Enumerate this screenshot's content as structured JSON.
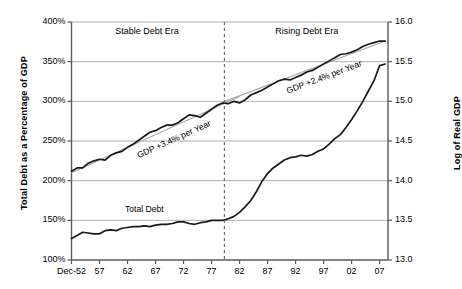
{
  "chart_data": {
    "type": "line",
    "title": "",
    "xlabel": "",
    "ylabel": "Total Debt as a Percentage of GDP",
    "y2label": "Log of Real GDP",
    "grid": true,
    "legend": "none",
    "x_tick_labels": [
      "Dec-52",
      "57",
      "62",
      "67",
      "72",
      "77",
      "82",
      "87",
      "92",
      "97",
      "02",
      "07"
    ],
    "x_tick_years": [
      1952,
      1957,
      1962,
      1967,
      1972,
      1977,
      1982,
      1987,
      1992,
      1997,
      2002,
      2007
    ],
    "xlim": [
      1952,
      2008.5
    ],
    "ylim": [
      100,
      400
    ],
    "y_tick_labels": [
      "100%",
      "150%",
      "200%",
      "250%",
      "300%",
      "350%",
      "400%"
    ],
    "y_ticks": [
      100,
      150,
      200,
      250,
      300,
      350,
      400
    ],
    "y2lim": [
      13.0,
      16.0
    ],
    "y2_tick_labels": [
      "13.0",
      "13.5",
      "14.0",
      "14.5",
      "15.0",
      "15.5",
      "16.0"
    ],
    "y2_ticks": [
      13.0,
      13.5,
      14.0,
      14.5,
      15.0,
      15.5,
      16.0
    ],
    "series": [
      {
        "name": "Total Debt",
        "axis": "left",
        "units": "percent of GDP",
        "color": "#1a1a1a",
        "x": [
          1952,
          1953,
          1954,
          1955,
          1956,
          1957,
          1958,
          1959,
          1960,
          1961,
          1962,
          1963,
          1964,
          1965,
          1966,
          1967,
          1968,
          1969,
          1970,
          1971,
          1972,
          1973,
          1974,
          1975,
          1976,
          1977,
          1978,
          1979,
          1980,
          1981,
          1982,
          1983,
          1984,
          1985,
          1986,
          1987,
          1988,
          1989,
          1990,
          1991,
          1992,
          1993,
          1994,
          1995,
          1996,
          1997,
          1998,
          1999,
          2000,
          2001,
          2002,
          2003,
          2004,
          2005,
          2006,
          2007,
          2008
        ],
        "values": [
          127,
          131,
          135,
          134,
          133,
          133,
          137,
          138,
          137,
          140,
          141,
          142,
          142,
          143,
          142,
          144,
          145,
          145,
          146,
          148,
          148,
          146,
          145,
          147,
          148,
          150,
          150,
          150,
          152,
          155,
          160,
          167,
          175,
          186,
          199,
          209,
          216,
          221,
          226,
          229,
          230,
          232,
          231,
          233,
          237,
          240,
          246,
          253,
          258,
          267,
          277,
          288,
          300,
          313,
          326,
          345,
          347
        ]
      },
      {
        "name": "Log of Real GDP",
        "axis": "right",
        "units": "log index",
        "color": "#1a1a1a",
        "x": [
          1952,
          1953,
          1954,
          1955,
          1956,
          1957,
          1958,
          1959,
          1960,
          1961,
          1962,
          1963,
          1964,
          1965,
          1966,
          1967,
          1968,
          1969,
          1970,
          1971,
          1972,
          1973,
          1974,
          1975,
          1976,
          1977,
          1978,
          1979,
          1980,
          1981,
          1982,
          1983,
          1984,
          1985,
          1986,
          1987,
          1988,
          1989,
          1990,
          1991,
          1992,
          1993,
          1994,
          1995,
          1996,
          1997,
          1998,
          1999,
          2000,
          2001,
          2002,
          2003,
          2004,
          2005,
          2006,
          2007,
          2008
        ],
        "values": [
          14.12,
          14.16,
          14.16,
          14.22,
          14.25,
          14.27,
          14.26,
          14.32,
          14.35,
          14.37,
          14.42,
          14.46,
          14.51,
          14.56,
          14.61,
          14.63,
          14.67,
          14.7,
          14.7,
          14.73,
          14.78,
          14.83,
          14.82,
          14.8,
          14.85,
          14.9,
          14.95,
          14.98,
          14.97,
          15.0,
          14.98,
          15.02,
          15.08,
          15.11,
          15.14,
          15.18,
          15.22,
          15.26,
          15.28,
          15.27,
          15.3,
          15.33,
          15.37,
          15.39,
          15.43,
          15.47,
          15.51,
          15.55,
          15.59,
          15.6,
          15.62,
          15.65,
          15.69,
          15.72,
          15.74,
          15.76,
          15.76
        ]
      }
    ],
    "trend_lines": [
      {
        "name": "gdp-trend-stable-era",
        "label": "GDP +3.4% per Year",
        "axis": "right",
        "growth_rate_percent": 3.4,
        "color": "#a8a8a8",
        "x_start": 1952,
        "x_end": 1982,
        "y_start": 14.1,
        "y_end": 15.06
      },
      {
        "name": "gdp-trend-rising-era",
        "label": "GDP +2.4% per Year",
        "axis": "right",
        "growth_rate_percent": 2.4,
        "color": "#a8a8a8",
        "x_start": 1979,
        "x_end": 2008,
        "y_start": 14.99,
        "y_end": 15.76
      }
    ],
    "series_annotations": [
      {
        "name": "total-debt-label",
        "text": "Total Debt",
        "x": 1965,
        "y": 160,
        "axis": "left"
      }
    ],
    "divider": {
      "name": "era-divider",
      "x": 1979.3,
      "style": "dashed",
      "color": "#6f6f6f"
    },
    "era_labels": [
      {
        "name": "stable-debt-era-label",
        "text": "Stable Debt Era",
        "x_center": 1965.5
      },
      {
        "name": "rising-debt-era-label",
        "text": "Rising Debt Era",
        "x_center": 1994.0
      }
    ]
  }
}
